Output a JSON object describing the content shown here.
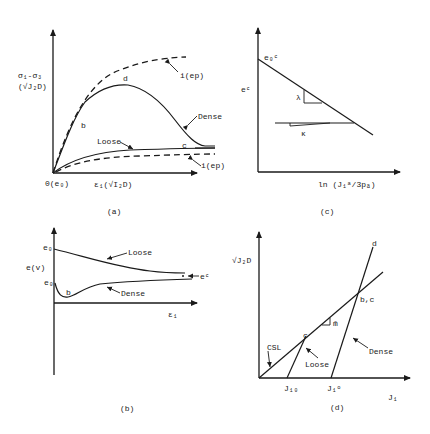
{
  "figure": {
    "panel_a": {
      "caption": "(a)",
      "y_axis_label_line1": "σ₁-σ₃",
      "y_axis_label_line2": "(√J₂D)",
      "x_axis_label": "ε₁(√I₂D)",
      "origin_label": "0(e₀)",
      "curves": {
        "dense": "Dense",
        "loose": "Loose",
        "ideal_upper": "i(ep)",
        "ideal_lower": "i(ep)"
      },
      "points": {
        "b": "b",
        "d": "d",
        "c": "c"
      }
    },
    "panel_b": {
      "caption": "(b)",
      "y_axis_label": "e(v)",
      "x_axis_label": "ε₁",
      "e0_loose": "e₀",
      "e0_dense": "e₀",
      "ec_label": "eᶜ",
      "curves": {
        "loose": "Loose",
        "dense": "Dense"
      },
      "points": {
        "b": "b"
      }
    },
    "panel_c": {
      "caption": "(c)",
      "y_axis_label": "eᶜ",
      "x_axis_label": "ln (J₁ᵃ/3pₐ)",
      "intercept_label": "e₀ᶜ",
      "slope_lambda": "λ",
      "slope_kappa": "κ"
    },
    "panel_d": {
      "caption": "(d)",
      "y_axis_label": "√J₂D",
      "x_axis_label": "J₁",
      "csl_label": "CSL",
      "slope_label": "m̄",
      "loose_label": "Loose",
      "dense_label": "Dense",
      "j10_label": "J₁₀",
      "j1o_label": "J₁ᵒ",
      "points": {
        "c": "c",
        "bc": "b,c",
        "d": "d"
      }
    }
  }
}
